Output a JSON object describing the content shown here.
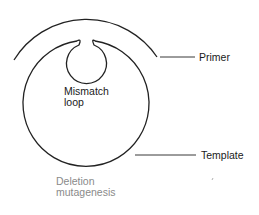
{
  "diagram": {
    "title": "Deletion mutagenesis",
    "labels": {
      "primer": "Primer",
      "template": "Template",
      "loop_line1": "Mismatch",
      "loop_line2": "loop",
      "caption_line1": "Deletion",
      "caption_line2": "mutagenesis"
    },
    "colors": {
      "stroke": "#222222",
      "caption": "#8a8a8a",
      "text": "#1a1a1a",
      "background": "#ffffff"
    }
  }
}
